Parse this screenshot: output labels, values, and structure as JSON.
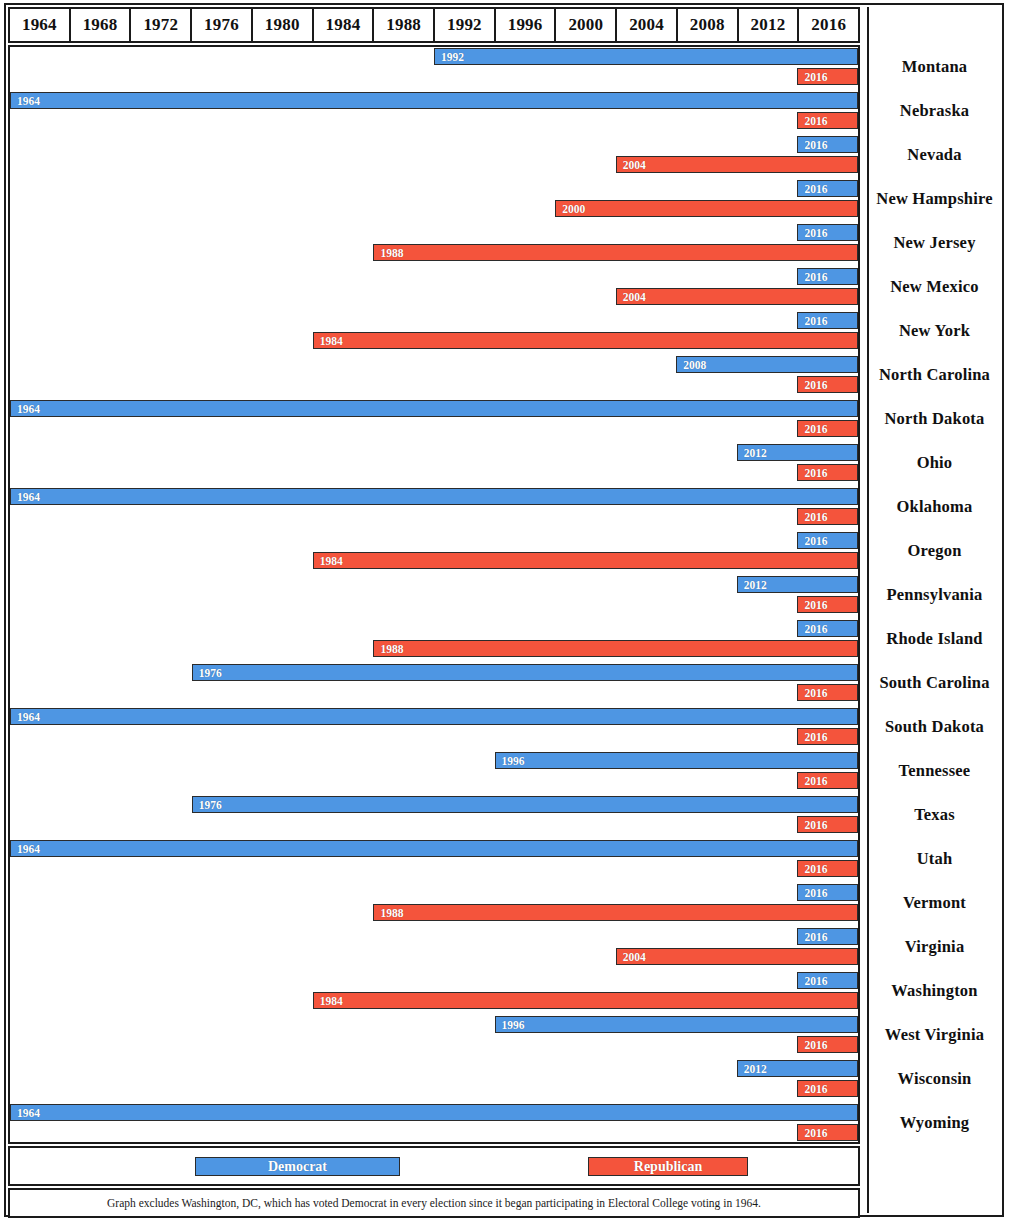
{
  "chart_data": {
    "type": "bar",
    "title": "",
    "subtitle": "",
    "xlabel": "",
    "ylabel": "",
    "orientation": "horizontal",
    "grid": false,
    "legend_position": "bottom",
    "xlim": [
      1964,
      2020
    ],
    "x_tick_labels": [
      "1964",
      "1968",
      "1972",
      "1976",
      "1980",
      "1984",
      "1988",
      "1992",
      "1996",
      "2000",
      "2004",
      "2008",
      "2012",
      "2016"
    ],
    "bar_end_year": 2020,
    "annotation": "Graph excludes Washington, DC, which has voted Democrat in every election since it began participating in Electoral College voting in 1964.",
    "series": [
      {
        "name": "Democrat",
        "color": "#4e96e3"
      },
      {
        "name": "Republican",
        "color": "#f4543c"
      }
    ],
    "categories": [
      "Montana",
      "Nebraska",
      "Nevada",
      "New Hampshire",
      "New Jersey",
      "New Mexico",
      "New York",
      "North Carolina",
      "North Dakota",
      "Ohio",
      "Oklahoma",
      "Oregon",
      "Pennsylvania",
      "Rhode Island",
      "South Carolina",
      "South Dakota",
      "Tennessee",
      "Texas",
      "Utah",
      "Vermont",
      "Virginia",
      "Washington",
      "West Virginia",
      "Wisconsin",
      "Wyoming"
    ],
    "rows": [
      {
        "state": "Montana",
        "democrat_start": 1992,
        "republican_start": 2016
      },
      {
        "state": "Nebraska",
        "democrat_start": 1964,
        "republican_start": 2016
      },
      {
        "state": "Nevada",
        "democrat_start": 2016,
        "republican_start": 2004
      },
      {
        "state": "New Hampshire",
        "democrat_start": 2016,
        "republican_start": 2000
      },
      {
        "state": "New Jersey",
        "democrat_start": 2016,
        "republican_start": 1988
      },
      {
        "state": "New Mexico",
        "democrat_start": 2016,
        "republican_start": 2004
      },
      {
        "state": "New York",
        "democrat_start": 2016,
        "republican_start": 1984
      },
      {
        "state": "North Carolina",
        "democrat_start": 2008,
        "republican_start": 2016
      },
      {
        "state": "North Dakota",
        "democrat_start": 1964,
        "republican_start": 2016
      },
      {
        "state": "Ohio",
        "democrat_start": 2012,
        "republican_start": 2016
      },
      {
        "state": "Oklahoma",
        "democrat_start": 1964,
        "republican_start": 2016
      },
      {
        "state": "Oregon",
        "democrat_start": 2016,
        "republican_start": 1984
      },
      {
        "state": "Pennsylvania",
        "democrat_start": 2012,
        "republican_start": 2016
      },
      {
        "state": "Rhode Island",
        "democrat_start": 2016,
        "republican_start": 1988
      },
      {
        "state": "South Carolina",
        "democrat_start": 1976,
        "republican_start": 2016
      },
      {
        "state": "South Dakota",
        "democrat_start": 1964,
        "republican_start": 2016
      },
      {
        "state": "Tennessee",
        "democrat_start": 1996,
        "republican_start": 2016
      },
      {
        "state": "Texas",
        "democrat_start": 1976,
        "republican_start": 2016
      },
      {
        "state": "Utah",
        "democrat_start": 1964,
        "republican_start": 2016
      },
      {
        "state": "Vermont",
        "democrat_start": 2016,
        "republican_start": 1988
      },
      {
        "state": "Virginia",
        "democrat_start": 2016,
        "republican_start": 2004
      },
      {
        "state": "Washington",
        "democrat_start": 2016,
        "republican_start": 1984
      },
      {
        "state": "West Virginia",
        "democrat_start": 1996,
        "republican_start": 2016
      },
      {
        "state": "Wisconsin",
        "democrat_start": 2012,
        "republican_start": 2016
      },
      {
        "state": "Wyoming",
        "democrat_start": 1964,
        "republican_start": 2016
      }
    ]
  },
  "axis": {
    "years": [
      "1964",
      "1968",
      "1972",
      "1976",
      "1980",
      "1984",
      "1988",
      "1992",
      "1996",
      "2000",
      "2004",
      "2008",
      "2012",
      "2016"
    ]
  },
  "legend": {
    "democrat_label": "Democrat",
    "republican_label": "Republican",
    "democrat_color": "#4e96e3",
    "republican_color": "#f4543c"
  },
  "footnote": {
    "text": "Graph excludes Washington, DC, which has voted Democrat in every election since it began participating in Electoral College voting in 1964."
  }
}
